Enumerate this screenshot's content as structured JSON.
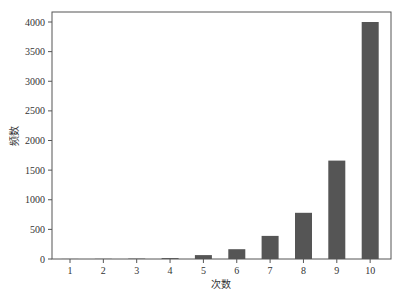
{
  "chart_data": {
    "type": "bar",
    "title": "",
    "xlabel": "次数",
    "ylabel": "频数",
    "categories": [
      "1",
      "2",
      "3",
      "4",
      "5",
      "6",
      "7",
      "8",
      "9",
      "10"
    ],
    "values": [
      1,
      3,
      6,
      15,
      65,
      165,
      390,
      780,
      1660,
      4000
    ],
    "ylim": [
      0,
      4150
    ],
    "yticks": [
      0,
      500,
      1000,
      1500,
      2000,
      2500,
      3000,
      3500,
      4000
    ],
    "grid": false,
    "legend": null,
    "bar_color": "#555555"
  }
}
